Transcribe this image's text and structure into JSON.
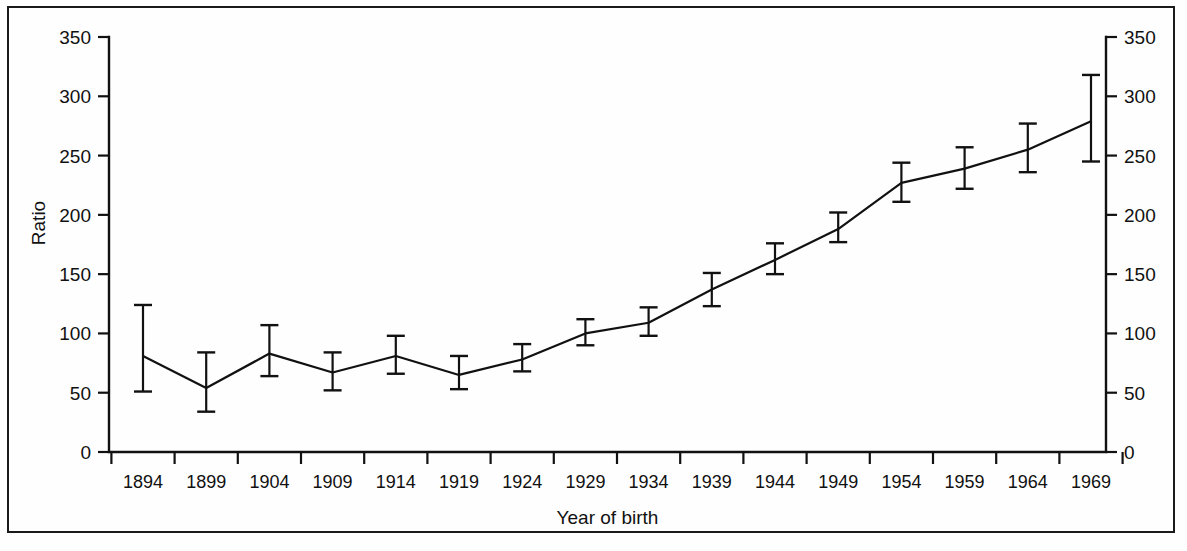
{
  "chart_data": {
    "type": "line",
    "title": "",
    "subtitle": "",
    "xlabel": "Year of birth",
    "ylabel": "Ratio",
    "categories": [
      "1894",
      "1899",
      "1904",
      "1909",
      "1914",
      "1919",
      "1924",
      "1929",
      "1934",
      "1939",
      "1944",
      "1949",
      "1954",
      "1959",
      "1964",
      "1969"
    ],
    "x": [
      1894,
      1899,
      1904,
      1909,
      1914,
      1919,
      1924,
      1929,
      1934,
      1939,
      1944,
      1949,
      1954,
      1959,
      1964,
      1969
    ],
    "values": [
      81,
      54,
      83,
      67,
      81,
      65,
      78,
      100,
      109,
      137,
      162,
      188,
      227,
      239,
      255,
      279
    ],
    "error_low": [
      51,
      34,
      64,
      52,
      66,
      53,
      68,
      90,
      98,
      123,
      150,
      177,
      211,
      222,
      236,
      245
    ],
    "error_high": [
      124,
      84,
      107,
      84,
      98,
      81,
      91,
      112,
      122,
      151,
      176,
      202,
      244,
      257,
      277,
      318
    ],
    "series": [
      {
        "name": "Ratio",
        "values": [
          81,
          54,
          83,
          67,
          81,
          65,
          78,
          100,
          109,
          137,
          162,
          188,
          227,
          239,
          255,
          279
        ],
        "error_low": [
          51,
          34,
          64,
          52,
          66,
          53,
          68,
          90,
          98,
          123,
          150,
          177,
          211,
          222,
          236,
          245
        ],
        "error_high": [
          124,
          84,
          107,
          84,
          98,
          81,
          91,
          112,
          122,
          151,
          176,
          202,
          244,
          257,
          277,
          318
        ]
      }
    ],
    "error_bar_style": "95% confidence interval",
    "ylim": [
      0,
      350
    ],
    "ytick_labels": [
      "0",
      "50",
      "100",
      "150",
      "200",
      "250",
      "300",
      "350"
    ],
    "ytick_values": [
      0,
      50,
      100,
      150,
      200,
      250,
      300,
      350
    ],
    "grid": false,
    "legend": null,
    "legend_position": "none",
    "right_axis": {
      "mirror_of_left": true,
      "ytick_labels": [
        "0",
        "50",
        "100",
        "150",
        "200",
        "250",
        "300",
        "350"
      ],
      "ytick_values": [
        0,
        50,
        100,
        150,
        200,
        250,
        300,
        350
      ]
    },
    "colors": {
      "line": "#111111",
      "axis": "#111111",
      "background": "#fefefe",
      "text": "#111111"
    }
  },
  "figure": {
    "frame_border": true,
    "axis_label_left": "Ratio",
    "axis_label_bottom": "Year of birth"
  }
}
